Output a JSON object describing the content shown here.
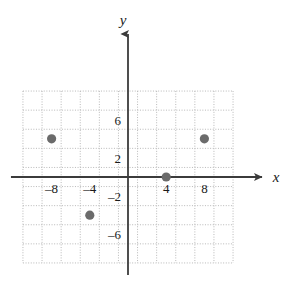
{
  "chart_data": {
    "type": "scatter",
    "title": "",
    "xlabel": "x",
    "ylabel": "y",
    "grid": true,
    "grid_style": "dotted",
    "grid_step": 2,
    "legend": "none",
    "xlim": [
      -11,
      11
    ],
    "ylim": [
      -9,
      9
    ],
    "x_ticks": [
      -8,
      -4,
      4,
      8
    ],
    "y_ticks": [
      6,
      2,
      -2,
      -6
    ],
    "x_tick_labels": [
      "–8",
      "–4",
      "4",
      "8"
    ],
    "y_tick_labels": [
      "6",
      "2",
      "–2",
      "–6"
    ],
    "points": [
      {
        "label": "point-1",
        "x": -8,
        "y": 4
      },
      {
        "label": "point-2",
        "x": 8,
        "y": 4
      },
      {
        "label": "point-3",
        "x": 4,
        "y": 0
      },
      {
        "label": "point-4",
        "x": -4,
        "y": -4
      }
    ],
    "marker_color": "#6b6b6b",
    "marker_radius": 4.6,
    "axis_color": "#3b3b3b",
    "grid_color": "#b8b8b8"
  },
  "axes": {
    "x_axis_label": "x",
    "y_axis_label": "y"
  },
  "icons": {
    "x_arrow": "arrow-right-icon",
    "y_arrow": "arrow-up-icon"
  }
}
